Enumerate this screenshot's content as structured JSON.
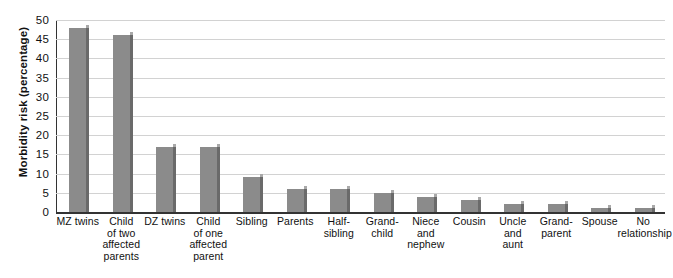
{
  "chart_data": {
    "type": "bar",
    "title": "",
    "xlabel": "",
    "ylabel": "Morbidity risk (percentage)",
    "ylim": [
      0,
      50
    ],
    "ytick_step": 5,
    "yticks": [
      50,
      45,
      40,
      35,
      30,
      25,
      20,
      15,
      10,
      5,
      0
    ],
    "grid": true,
    "legend": null,
    "bar_color": "#8b8b8b",
    "bar_shadow_color": "#6a6a6a",
    "categories": [
      "MZ twins",
      "Child of two affected parents",
      "DZ twins",
      "Child of one affected parent",
      "Sibling",
      "Parents",
      "Half-sibling",
      "Grandchild",
      "Niece and nephew",
      "Cousin",
      "Uncle and aunt",
      "Grandparent",
      "Spouse",
      "No relationship"
    ],
    "category_lines": [
      [
        "MZ twins"
      ],
      [
        "Child",
        "of two",
        "affected",
        "parents"
      ],
      [
        "DZ twins"
      ],
      [
        "Child",
        "of one",
        "affected",
        "parent"
      ],
      [
        "Sibling"
      ],
      [
        "Parents"
      ],
      [
        "Half-",
        "sibling"
      ],
      [
        "Grand-",
        "child"
      ],
      [
        "Niece",
        "and",
        "nephew"
      ],
      [
        "Cousin"
      ],
      [
        "Uncle",
        "and",
        "aunt"
      ],
      [
        "Grand-",
        "parent"
      ],
      [
        "Spouse"
      ],
      [
        "No",
        "relationship"
      ]
    ],
    "values": [
      48,
      46,
      17,
      17,
      9,
      6,
      6,
      5,
      4,
      3,
      2,
      2,
      1,
      1
    ]
  }
}
